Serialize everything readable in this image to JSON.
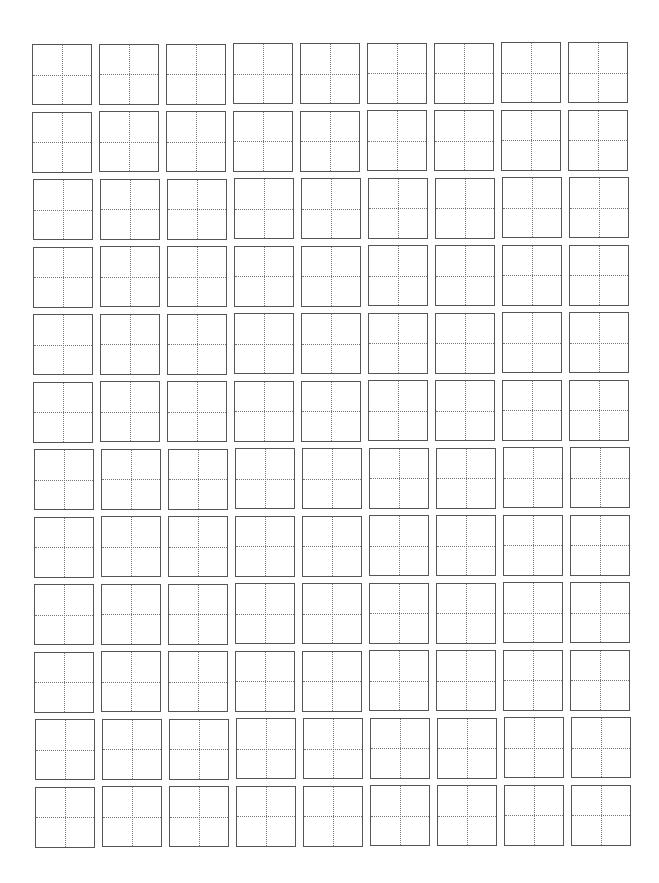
{
  "worksheet": {
    "type": "tianzige-practice-grid",
    "rows": 12,
    "columns": 9,
    "cell_size_px": 60,
    "origin_x": 32,
    "origin_y": 44,
    "spacing_x": 67,
    "spacing_y": 67.5,
    "border_color": "#555555",
    "guide_color": "#777777",
    "guide_style": "dotted"
  }
}
